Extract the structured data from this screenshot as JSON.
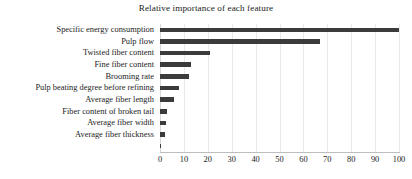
{
  "chart_data": {
    "type": "bar",
    "orientation": "horizontal",
    "title": "Relative importance of each feature",
    "xlabel": "",
    "ylabel": "",
    "xlim": [
      0,
      100
    ],
    "xticks": [
      0,
      10,
      20,
      30,
      40,
      50,
      60,
      70,
      80,
      90,
      100
    ],
    "xtick_labels": [
      "0",
      "10",
      "20",
      "30",
      "40",
      "50",
      "60",
      "70",
      "80",
      "90",
      "100"
    ],
    "grid": true,
    "legend": false,
    "bar_color": "#3b3b3b",
    "grid_color": "#e9e9e9",
    "categories": [
      "Specific energy consumption",
      "Pulp flow",
      "Twisted fiber content",
      "Fine fiber content",
      "Brooming rate",
      "Pulp beating degree before refining",
      "Average fiber length",
      "Fiber content of broken tail",
      "Average fiber width",
      "Average fiber thickness",
      ""
    ],
    "values": [
      100,
      67,
      21,
      13,
      12,
      8,
      6,
      3,
      2.5,
      2,
      0.6
    ]
  }
}
